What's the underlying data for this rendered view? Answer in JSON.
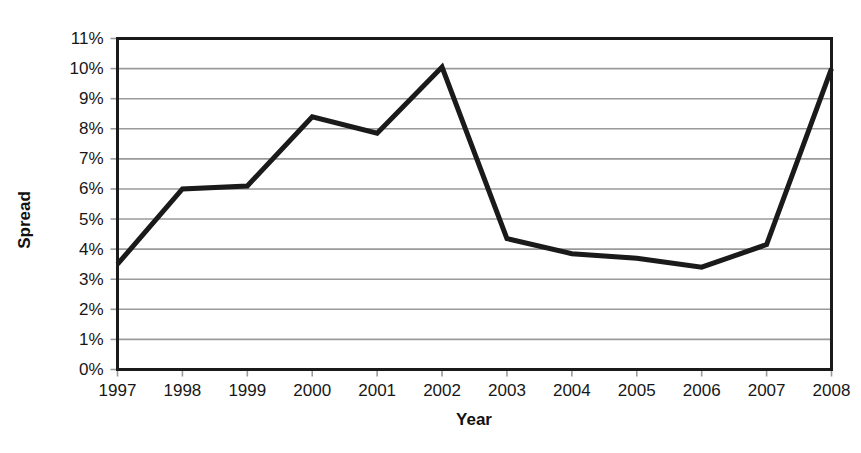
{
  "chart_data": {
    "type": "line",
    "title": "",
    "xlabel": "Year",
    "ylabel": "Spread",
    "categories": [
      "1997",
      "1998",
      "1999",
      "2000",
      "2001",
      "2002",
      "2003",
      "2004",
      "2005",
      "2006",
      "2007",
      "2008"
    ],
    "x": [
      1997,
      1998,
      1999,
      2000,
      2001,
      2002,
      2003,
      2004,
      2005,
      2006,
      2007,
      2008
    ],
    "values": [
      3.5,
      6.0,
      6.1,
      8.4,
      7.85,
      10.05,
      4.35,
      3.85,
      3.7,
      3.4,
      4.15,
      10.0
    ],
    "series": [
      {
        "name": "Spread",
        "values": [
          3.5,
          6.0,
          6.1,
          8.4,
          7.85,
          10.05,
          4.35,
          3.85,
          3.7,
          3.4,
          4.15,
          10.0
        ]
      }
    ],
    "ylim": [
      0,
      11
    ],
    "xlim": [
      1997,
      2008
    ],
    "ytick_labels": [
      "0%",
      "1%",
      "2%",
      "3%",
      "4%",
      "5%",
      "6%",
      "7%",
      "8%",
      "9%",
      "10%",
      "11%"
    ],
    "ytick_values": [
      0,
      1,
      2,
      3,
      4,
      5,
      6,
      7,
      8,
      9,
      10,
      11
    ],
    "yunit": "%",
    "grid": "horizontal",
    "legend": "none",
    "line_color": "#1a1a1a",
    "line_width": 5,
    "grid_color": "#9a9a9a",
    "axis_color": "#1a1a1a",
    "background_color": "#ffffff"
  },
  "axis_titles": {
    "y": "Spread",
    "x": "Year"
  }
}
